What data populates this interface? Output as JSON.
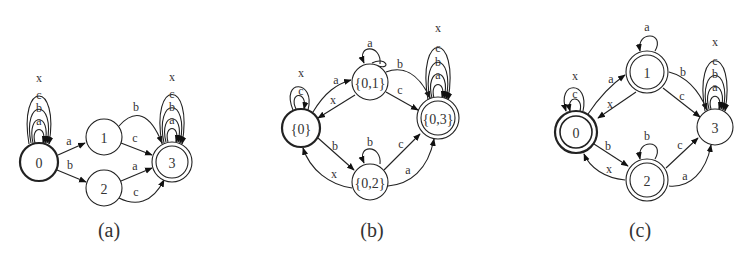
{
  "figure": {
    "panels": [
      {
        "id": "a",
        "caption": "(a)",
        "nodes": [
          {
            "id": "0",
            "label": "0",
            "x": 39,
            "y": 162,
            "r": 20,
            "start": true,
            "accept": false
          },
          {
            "id": "1",
            "label": "1",
            "x": 104,
            "y": 137,
            "r": 18,
            "start": false,
            "accept": false
          },
          {
            "id": "2",
            "label": "2",
            "x": 104,
            "y": 188,
            "r": 18,
            "start": false,
            "accept": false
          },
          {
            "id": "3",
            "label": "3",
            "x": 172,
            "y": 162,
            "r": 20,
            "start": false,
            "accept": true
          }
        ],
        "edges": [
          {
            "from": "0",
            "to": "0",
            "labels": [
              "a",
              "b",
              "c",
              "x"
            ]
          },
          {
            "from": "0",
            "to": "1",
            "label": "a"
          },
          {
            "from": "0",
            "to": "2",
            "label": "b"
          },
          {
            "from": "1",
            "to": "3",
            "label": "b"
          },
          {
            "from": "1",
            "to": "3",
            "label": "c"
          },
          {
            "from": "2",
            "to": "3",
            "label": "a"
          },
          {
            "from": "2",
            "to": "3",
            "label": "c"
          },
          {
            "from": "3",
            "to": "3",
            "labels": [
              "a",
              "b",
              "c",
              "x"
            ]
          }
        ]
      },
      {
        "id": "b",
        "caption": "(b)",
        "nodes": [
          {
            "id": "{0}",
            "label": "{0}",
            "x": 301,
            "y": 128,
            "r": 20,
            "start": true,
            "accept": false
          },
          {
            "id": "{0,1}",
            "label": "{0,1}",
            "x": 370,
            "y": 82,
            "r": 19,
            "start": false,
            "accept": false
          },
          {
            "id": "{0,2}",
            "label": "{0,2}",
            "x": 370,
            "y": 182,
            "r": 19,
            "start": false,
            "accept": false
          },
          {
            "id": "{0,3}",
            "label": "{0,3}",
            "x": 438,
            "y": 118,
            "r": 21,
            "start": false,
            "accept": true
          }
        ],
        "edges": [
          {
            "from": "{0}",
            "to": "{0}",
            "labels": [
              "c",
              "x"
            ]
          },
          {
            "from": "{0}",
            "to": "{0,1}",
            "label": "a"
          },
          {
            "from": "{0,1}",
            "to": "{0}",
            "label": "x"
          },
          {
            "from": "{0}",
            "to": "{0,2}",
            "label": "b"
          },
          {
            "from": "{0,2}",
            "to": "{0}",
            "label": "x"
          },
          {
            "from": "{0,1}",
            "to": "{0,1}",
            "label": "a"
          },
          {
            "from": "{0,2}",
            "to": "{0,2}",
            "label": "b"
          },
          {
            "from": "{0,1}",
            "to": "{0,3}",
            "label": "b"
          },
          {
            "from": "{0,1}",
            "to": "{0,3}",
            "label": "c"
          },
          {
            "from": "{0,2}",
            "to": "{0,3}",
            "label": "c"
          },
          {
            "from": "{0,2}",
            "to": "{0,3}",
            "label": "a"
          },
          {
            "from": "{0,3}",
            "to": "{0,3}",
            "labels": [
              "a",
              "b",
              "c",
              "x"
            ]
          }
        ]
      },
      {
        "id": "c",
        "caption": "(c)",
        "nodes": [
          {
            "id": "0",
            "label": "0",
            "x": 576,
            "y": 132,
            "r": 22,
            "start": true,
            "accept": true
          },
          {
            "id": "1",
            "label": "1",
            "x": 647,
            "y": 72,
            "r": 22,
            "start": false,
            "accept": true
          },
          {
            "id": "2",
            "label": "2",
            "x": 647,
            "y": 180,
            "r": 22,
            "start": false,
            "accept": true
          },
          {
            "id": "3",
            "label": "3",
            "x": 715,
            "y": 127,
            "r": 18,
            "start": false,
            "accept": false
          }
        ],
        "edges": [
          {
            "from": "0",
            "to": "0",
            "labels": [
              "c",
              "x"
            ]
          },
          {
            "from": "0",
            "to": "1",
            "label": "a"
          },
          {
            "from": "1",
            "to": "0",
            "label": "x"
          },
          {
            "from": "0",
            "to": "2",
            "label": "b"
          },
          {
            "from": "2",
            "to": "0",
            "label": "x"
          },
          {
            "from": "1",
            "to": "1",
            "label": "a"
          },
          {
            "from": "2",
            "to": "2",
            "label": "b"
          },
          {
            "from": "1",
            "to": "3",
            "label": "b"
          },
          {
            "from": "1",
            "to": "3",
            "label": "c"
          },
          {
            "from": "2",
            "to": "3",
            "label": "c"
          },
          {
            "from": "2",
            "to": "3",
            "label": "a"
          },
          {
            "from": "3",
            "to": "3",
            "labels": [
              "a",
              "b",
              "c",
              "x"
            ]
          }
        ]
      }
    ]
  },
  "text": {
    "a_cap": "(a)",
    "b_cap": "(b)",
    "c_cap": "(c)",
    "a_n0": "0",
    "a_n1": "1",
    "a_n2": "2",
    "a_n3": "3",
    "b_n0": "{0}",
    "b_n1": "{0,1}",
    "b_n2": "{0,2}",
    "b_n3": "{0,3}",
    "c_n0": "0",
    "c_n1": "1",
    "c_n2": "2",
    "c_n3": "3",
    "sa": "a",
    "sb": "b",
    "sc": "c",
    "sx": "x"
  }
}
